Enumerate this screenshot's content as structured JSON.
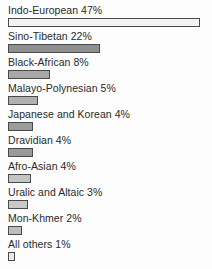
{
  "chart_data": {
    "type": "bar",
    "orientation": "horizontal",
    "title": "",
    "subtitle": "",
    "xlabel": "",
    "ylabel": "",
    "grid": false,
    "legend": "none",
    "xlim": [
      0,
      47
    ],
    "unit": "%",
    "categories": [
      "Indo-European",
      "Sino-Tibetan",
      "Black-African",
      "Malayo-Polynesian",
      "Japanese and Korean",
      "Dravidian",
      "Afro-Asian",
      "Uralic and Altaic",
      "Mon-Khmer",
      "All others"
    ],
    "values": [
      47,
      22,
      8,
      5,
      4,
      4,
      4,
      3,
      2,
      1
    ],
    "labels": [
      "Indo-European 47%",
      "Sino-Tibetan 22%",
      "Black-African 8%",
      "Malayo-Polynesian 5%",
      "Japanese and Korean 4%",
      "Dravidian 4%",
      "Afro-Asian 4%",
      "Uralic and Altaic 3%",
      "Mon-Khmer 2%",
      "All others 1%"
    ],
    "bar_widths_px": [
      192,
      92,
      42,
      30,
      25,
      25,
      23,
      20,
      14,
      7
    ],
    "bar_fills": [
      "#f2f2f2",
      "#8f8f8f",
      "#a8a8a8",
      "#b0b0b0",
      "#9d9d9d",
      "#9a9a9a",
      "#c4c4c4",
      "#c9c9c9",
      "#bdbdbd",
      "#e8e8e8"
    ],
    "bar_border_color": "#4a4a4a",
    "text_color": "#2a2a2a",
    "background": "#fdfdfd"
  }
}
